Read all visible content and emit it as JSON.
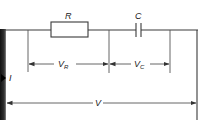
{
  "diagram": {
    "type": "series RC circuit",
    "components": [
      {
        "id": "resistor",
        "label": "R",
        "symbol": "rectangle"
      },
      {
        "id": "capacitor",
        "label": "C",
        "symbol": "parallel-plates"
      }
    ],
    "current_label": "I",
    "voltage_labels": {
      "resistor": "V",
      "resistor_sub": "R",
      "capacitor": "V",
      "capacitor_sub": "C",
      "total": "V"
    },
    "colors": {
      "line": "#3a3a3a",
      "background": "#ffffff",
      "edge_bar": "#111111"
    }
  }
}
